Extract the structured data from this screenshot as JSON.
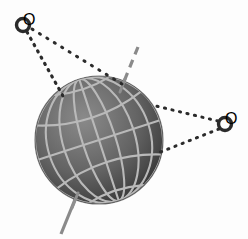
{
  "figure": {
    "title": "Tilted sphere with graticule and two external observer points",
    "width": 248,
    "height": 239,
    "background_color": "#fdfdfd",
    "caption": ""
  },
  "sphere": {
    "label": "sphere",
    "center_x": 99,
    "center_y": 140,
    "radius": 64,
    "fill_light_color": "#7b7b7b",
    "fill_mid_color": "#636363",
    "fill_dark_color": "#2e2e2e",
    "edge_color": "#242424",
    "highlight_offset_x": -24,
    "highlight_offset_y": -28
  },
  "graticule": {
    "label": "latitude and longitude grid",
    "line_color": "#b9b9b9",
    "line_width": 2.1,
    "meridian_count": 6,
    "parallel_count": 5,
    "axis_tilt_degrees": -18
  },
  "axis": {
    "label": "rotation axis",
    "color": "#8a8a8a",
    "dash_color": "#8a8a8a",
    "line_width": 3,
    "dash_pattern": "7 5",
    "north_x": 138,
    "north_y": 47,
    "south_x": 61,
    "south_y": 234,
    "pole_north_x": 123,
    "pole_north_y": 84,
    "pole_south_x": 76,
    "pole_south_y": 197
  },
  "nodes": [
    {
      "id": "node-upper-left",
      "label": "O",
      "name": "observer-point-upper-left",
      "x": 23,
      "y": 25,
      "outer_radius": 6.6,
      "inner_radius": 3.3,
      "stroke_color": "#2b2b2b"
    },
    {
      "id": "node-right",
      "label": "O",
      "name": "observer-point-right",
      "x": 225,
      "y": 124,
      "outer_radius": 6.6,
      "inner_radius": 3.3,
      "stroke_color": "#2b2b2b"
    }
  ],
  "tangent_lines": [
    {
      "id": "tangent-ul-lower",
      "label": "upper-left observer to left limb",
      "from_node": "node-upper-left",
      "x1": 27,
      "y1": 32,
      "x2": 62,
      "y2": 95,
      "style": "dotted",
      "color": "#2b2b2b",
      "width": 3,
      "dash_pattern": "1 6"
    },
    {
      "id": "tangent-ul-upper",
      "label": "upper-left observer to north pole limb",
      "from_node": "node-upper-left",
      "x1": 31,
      "y1": 29,
      "x2": 122,
      "y2": 84,
      "style": "dotted",
      "color": "#2b2b2b",
      "width": 3,
      "dash_pattern": "1 7"
    },
    {
      "id": "tangent-right-upper",
      "label": "right observer to upper-right limb",
      "from_node": "node-right",
      "x1": 218,
      "y1": 121,
      "x2": 157,
      "y2": 106,
      "style": "dotted",
      "color": "#2b2b2b",
      "width": 3,
      "dash_pattern": "1 6"
    },
    {
      "id": "tangent-right-lower",
      "label": "right observer to lower-right limb",
      "from_node": "node-right",
      "x1": 219,
      "y1": 129,
      "x2": 159,
      "y2": 152,
      "style": "dotted",
      "color": "#2b2b2b",
      "width": 3,
      "dash_pattern": "1 6"
    }
  ]
}
